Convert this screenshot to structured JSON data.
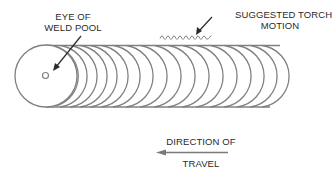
{
  "diagram": {
    "labels": {
      "eye_of_weld_pool_line1": "EYE OF",
      "eye_of_weld_pool_line2": "WELD POOL",
      "suggested_torch_motion_line1": "SUGGESTED TORCH",
      "suggested_torch_motion_line2": "MOTION",
      "direction_of_travel_line1": "DIRECTION OF",
      "direction_of_travel_line2": "TRAVEL"
    },
    "elements": {
      "bead_ripples_count": 17,
      "leading_pool": "full circle at left end with small eye circle",
      "torch_motion": "small wavy/looping line above bead",
      "direction_arrow": "points left"
    },
    "colors": {
      "stroke": "#7a7a7a",
      "arrow": "#2a2a2a",
      "text": "#2a2a2a",
      "background": "#ffffff"
    }
  }
}
